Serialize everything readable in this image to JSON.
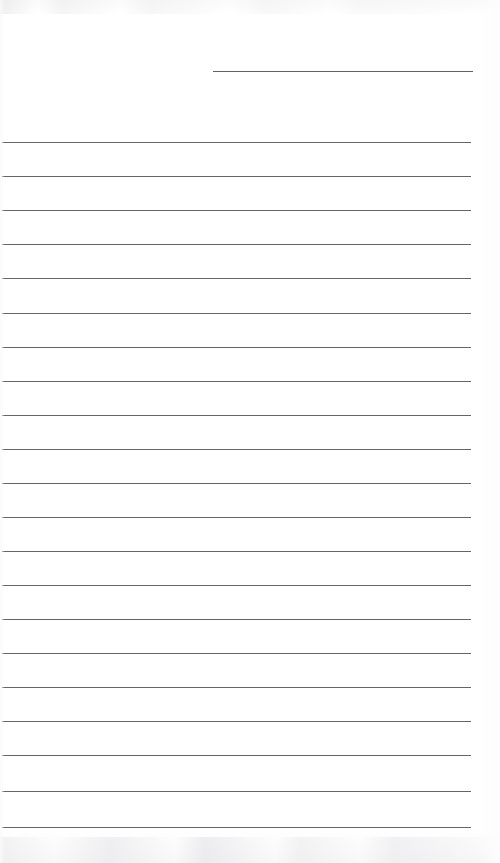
{
  "document": {
    "kind": "scanned-ruled-notepaper",
    "title": "",
    "page_width": 500,
    "page_height": 863,
    "background_color": "#fefefe",
    "rule_color": "#58585c",
    "rule_thickness_px": 1.6,
    "content_text": "",
    "is_blank": true
  },
  "header": {
    "rule": {
      "label": "header-signature-rule",
      "x": 213,
      "y": 71,
      "width": 260,
      "filled_value": ""
    }
  },
  "body": {
    "left_margin_x": 2,
    "right_edge_x": 471,
    "line_width": 469,
    "first_line_y": 142,
    "line_spacing_px": 34.25,
    "line_count": 21,
    "lines": [
      {
        "index": 1,
        "y": 142,
        "value": ""
      },
      {
        "index": 2,
        "y": 176,
        "value": ""
      },
      {
        "index": 3,
        "y": 210,
        "value": ""
      },
      {
        "index": 4,
        "y": 244,
        "value": ""
      },
      {
        "index": 5,
        "y": 278,
        "value": ""
      },
      {
        "index": 6,
        "y": 313,
        "value": ""
      },
      {
        "index": 7,
        "y": 347,
        "value": ""
      },
      {
        "index": 8,
        "y": 381,
        "value": ""
      },
      {
        "index": 9,
        "y": 415,
        "value": ""
      },
      {
        "index": 10,
        "y": 449,
        "value": ""
      },
      {
        "index": 11,
        "y": 483,
        "value": ""
      },
      {
        "index": 12,
        "y": 517,
        "value": ""
      },
      {
        "index": 13,
        "y": 551,
        "value": ""
      },
      {
        "index": 14,
        "y": 585,
        "value": ""
      },
      {
        "index": 15,
        "y": 619,
        "value": ""
      },
      {
        "index": 16,
        "y": 653,
        "value": ""
      },
      {
        "index": 17,
        "y": 687,
        "value": ""
      },
      {
        "index": 18,
        "y": 721,
        "value": ""
      },
      {
        "index": 19,
        "y": 755,
        "value": ""
      },
      {
        "index": 20,
        "y": 791,
        "value": ""
      },
      {
        "index": 21,
        "y": 827,
        "value": ""
      }
    ]
  }
}
